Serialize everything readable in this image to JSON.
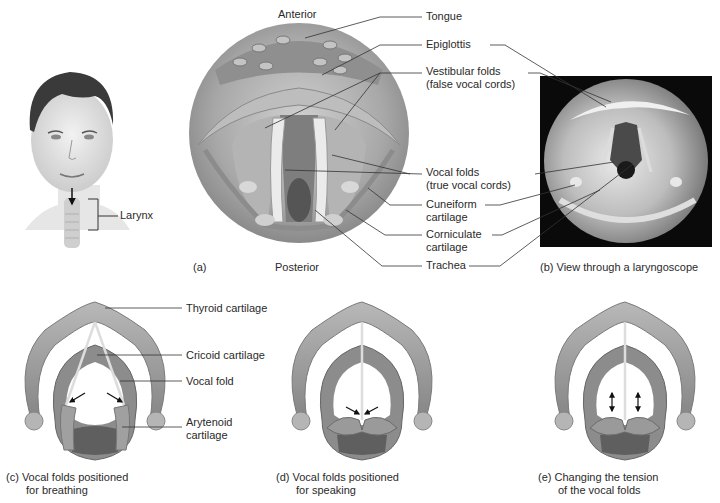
{
  "figure": {
    "head_panel": {
      "larynx_label": "Larynx"
    },
    "panel_a": {
      "letter": "(a)",
      "orientation_top": "Anterior",
      "orientation_bottom": "Posterior"
    },
    "panel_b": {
      "caption": "(b)  View through a laryngoscope"
    },
    "shared_labels": [
      {
        "line1": "Tongue",
        "line2": ""
      },
      {
        "line1": "Epiglottis",
        "line2": ""
      },
      {
        "line1": "Vestibular folds",
        "line2": "(false vocal cords)"
      },
      {
        "line1": "Vocal folds",
        "line2": "(true vocal cords)"
      },
      {
        "line1": "Cuneiform",
        "line2": "cartilage"
      },
      {
        "line1": "Corniculate",
        "line2": "cartilage"
      },
      {
        "line1": "Trachea",
        "line2": ""
      }
    ],
    "panel_c": {
      "caption_line1": "(c)  Vocal folds positioned",
      "caption_line2": "for breathing",
      "labels": {
        "thyroid": "Thyroid cartilage",
        "cricoid": "Cricoid cartilage",
        "vocal_fold": "Vocal fold",
        "arytenoid_1": "Arytenoid",
        "arytenoid_2": "cartilage"
      }
    },
    "panel_d": {
      "caption_line1": "(d)  Vocal folds positioned",
      "caption_line2": "for speaking"
    },
    "panel_e": {
      "caption_line1": "(e)  Changing the tension",
      "caption_line2": "of the vocal folds"
    },
    "colors": {
      "cartilage": "#9a9a9a",
      "cartilage_dark": "#6e6e6e",
      "photo_bg": "#0a0a0a",
      "leader_line": "#333333"
    }
  }
}
